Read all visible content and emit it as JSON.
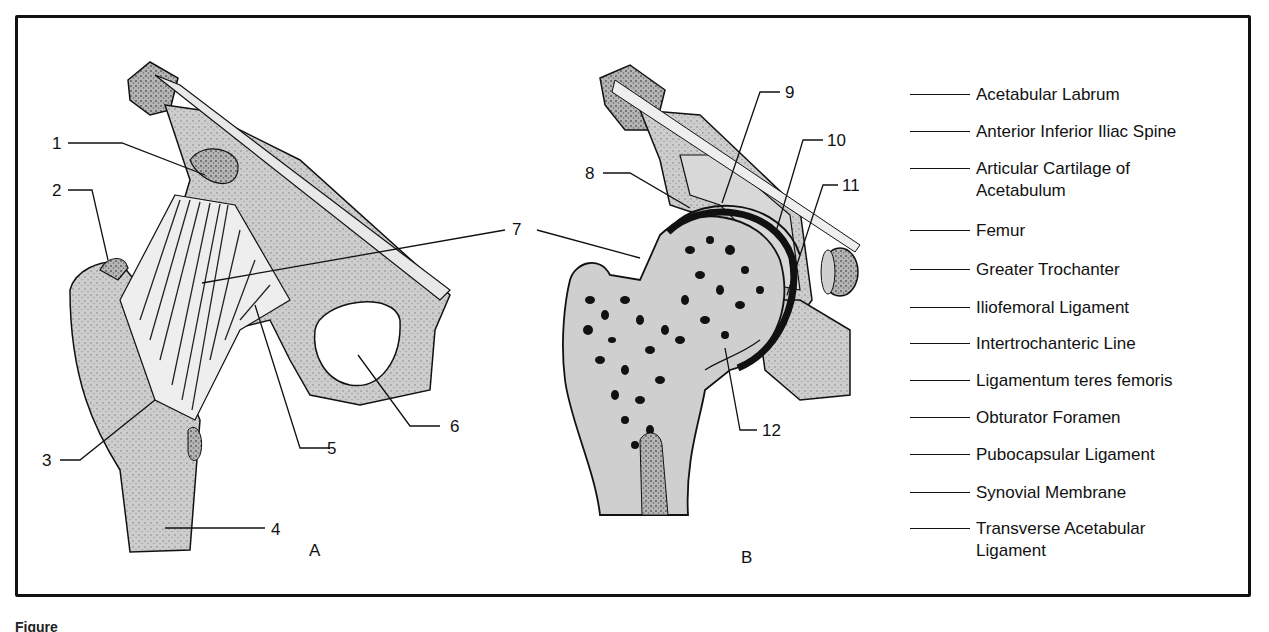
{
  "figure": {
    "panels": [
      {
        "id": "A",
        "label": "A"
      },
      {
        "id": "B",
        "label": "B"
      }
    ],
    "callouts": {
      "A": [
        "1",
        "2",
        "3",
        "4",
        "5",
        "6",
        "7"
      ],
      "B": [
        "7",
        "8",
        "9",
        "10",
        "11",
        "12"
      ]
    },
    "caption_partial": "Figure"
  },
  "legend": {
    "items": [
      {
        "label": "Acetabular Labrum"
      },
      {
        "label": "Anterior Inferior Iliac Spine"
      },
      {
        "label": "Articular Cartilage of\nAcetabulum"
      },
      {
        "label": "Femur"
      },
      {
        "label": "Greater Trochanter"
      },
      {
        "label": "Iliofemoral Ligament"
      },
      {
        "label": "Intertrochanteric Line"
      },
      {
        "label": "Ligamentum teres femoris"
      },
      {
        "label": "Obturator Foramen"
      },
      {
        "label": "Pubocapsular Ligament"
      },
      {
        "label": "Synovial Membrane"
      },
      {
        "label": "Transverse Acetabular\nLigament"
      }
    ]
  },
  "colors": {
    "bone_fill": "#cfcfcf",
    "bone_dark": "#8a8a8a",
    "ink": "#111111",
    "background": "#ffffff"
  }
}
